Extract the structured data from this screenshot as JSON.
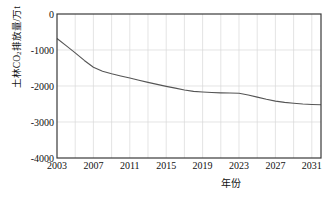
{
  "chart_data": {
    "type": "line",
    "title": "",
    "xlabel": "年份",
    "ylabel": "土林CO₂排放量/万t",
    "ylabel_parts": {
      "pre": "土林CO",
      "sub": "2",
      "post": "排放量/万t"
    },
    "x": [
      2003,
      2004,
      2005,
      2006,
      2007,
      2008,
      2009,
      2010,
      2011,
      2012,
      2013,
      2014,
      2015,
      2016,
      2017,
      2018,
      2019,
      2020,
      2021,
      2022,
      2023,
      2024,
      2025,
      2026,
      2027,
      2028,
      2029,
      2030,
      2031,
      2032
    ],
    "values": [
      -680,
      -880,
      -1080,
      -1290,
      -1480,
      -1590,
      -1660,
      -1720,
      -1780,
      -1840,
      -1900,
      -1955,
      -2010,
      -2060,
      -2110,
      -2150,
      -2165,
      -2180,
      -2190,
      -2195,
      -2200,
      -2250,
      -2310,
      -2370,
      -2420,
      -2455,
      -2480,
      -2500,
      -2512,
      -2520
    ],
    "series": [
      {
        "name": "土林CO₂排放量",
        "values": [
          -680,
          -880,
          -1080,
          -1290,
          -1480,
          -1590,
          -1660,
          -1720,
          -1780,
          -1840,
          -1900,
          -1955,
          -2010,
          -2060,
          -2110,
          -2150,
          -2165,
          -2180,
          -2190,
          -2195,
          -2200,
          -2250,
          -2310,
          -2370,
          -2420,
          -2455,
          -2480,
          -2500,
          -2512,
          -2520
        ],
        "color": "#555555"
      }
    ],
    "xlim": [
      2003,
      2032
    ],
    "ylim": [
      -4000,
      0
    ],
    "ytick_labels": [
      "0",
      "-1000",
      "-2000",
      "-3000",
      "-4000"
    ],
    "ytick_values": [
      0,
      -1000,
      -2000,
      -3000,
      -4000
    ],
    "xtick_labels": [
      "2003",
      "2007",
      "2011",
      "2015",
      "2019",
      "2023",
      "2027",
      "2031"
    ],
    "xtick_values": [
      2003,
      2007,
      2011,
      2015,
      2019,
      2023,
      2027,
      2031
    ],
    "grid": {
      "vertical": true,
      "horizontal": true,
      "vertical_step_years": 2,
      "color": "#d8d8d8"
    },
    "legend": {
      "visible": false,
      "position": "none"
    },
    "frame_color": "#3a3a3a",
    "background": "#ffffff"
  }
}
